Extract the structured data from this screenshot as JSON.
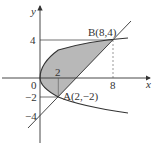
{
  "diagram": {
    "axes": {
      "x_label": "x",
      "y_label": "y",
      "origin_label": "0"
    },
    "ticks": {
      "x": [
        "2",
        "8"
      ],
      "y": [
        "4",
        "−2",
        "−4"
      ]
    },
    "points": {
      "A": {
        "label": "A(2,−2)",
        "x": 2,
        "y": -2
      },
      "B": {
        "label": "B(8,4)",
        "x": 8,
        "y": 4
      }
    },
    "curves": [
      {
        "name": "parabola",
        "equation": "y^2 = 2x"
      },
      {
        "name": "line",
        "equation": "y = x - 4"
      }
    ],
    "shaded_region": "between parabola y^2=2x and line y=x-4 from A to B",
    "colors": {
      "shade": "#b8b8b8",
      "stroke": "#333333"
    }
  }
}
